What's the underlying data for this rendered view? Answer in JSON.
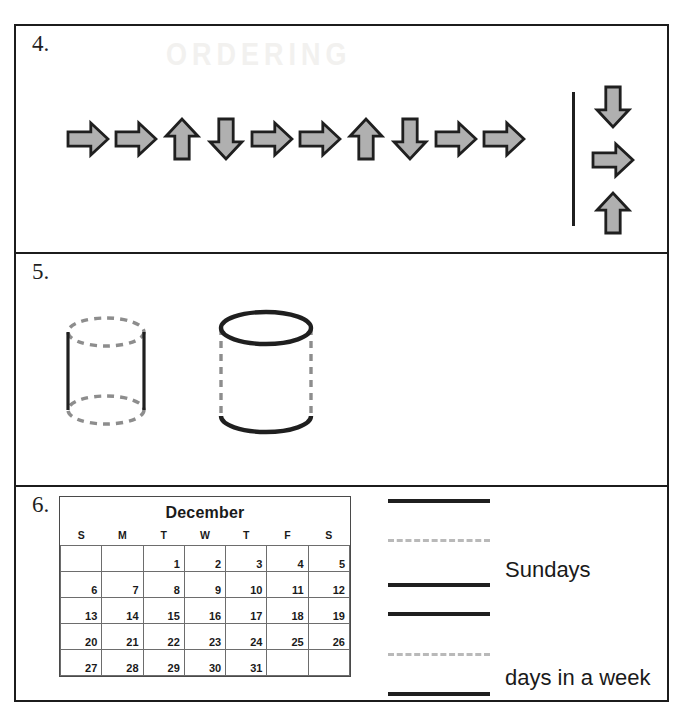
{
  "worksheet": {
    "ghost_text": "ORDERING",
    "sections": [
      {
        "number": "4.",
        "name": "arrow-pattern-question",
        "pattern": [
          {
            "direction": "right",
            "icon": "arrow-right-icon"
          },
          {
            "direction": "right",
            "icon": "arrow-right-icon"
          },
          {
            "direction": "up",
            "icon": "arrow-up-icon"
          },
          {
            "direction": "down",
            "icon": "arrow-down-icon"
          },
          {
            "direction": "right",
            "icon": "arrow-right-icon"
          },
          {
            "direction": "right",
            "icon": "arrow-right-icon"
          },
          {
            "direction": "up",
            "icon": "arrow-up-icon"
          },
          {
            "direction": "down",
            "icon": "arrow-down-icon"
          },
          {
            "direction": "right",
            "icon": "arrow-right-icon"
          },
          {
            "direction": "right",
            "icon": "arrow-right-icon"
          }
        ],
        "choices": [
          {
            "direction": "down",
            "icon": "arrow-down-icon"
          },
          {
            "direction": "right",
            "icon": "arrow-right-icon"
          },
          {
            "direction": "up",
            "icon": "arrow-up-icon"
          }
        ]
      },
      {
        "number": "5.",
        "name": "cylinder-comparison-question",
        "shapes": [
          {
            "label": "cylinder-dashed-ends",
            "edges": {
              "top": "dashed",
              "bottom": "dashed",
              "sides": "solid"
            }
          },
          {
            "label": "cylinder-solid-ends",
            "edges": {
              "top": "solid",
              "bottom": "solid",
              "sides": "dashed"
            }
          }
        ]
      },
      {
        "number": "6.",
        "name": "calendar-question",
        "calendar": {
          "title": "December",
          "weekday_headers": [
            "S",
            "M",
            "T",
            "W",
            "T",
            "F",
            "S"
          ],
          "weeks": [
            [
              "",
              "",
              "1",
              "2",
              "3",
              "4",
              "5"
            ],
            [
              "6",
              "7",
              "8",
              "9",
              "10",
              "11",
              "12"
            ],
            [
              "13",
              "14",
              "15",
              "16",
              "17",
              "18",
              "19"
            ],
            [
              "20",
              "21",
              "22",
              "23",
              "24",
              "25",
              "26"
            ],
            [
              "27",
              "28",
              "29",
              "30",
              "31",
              "",
              ""
            ]
          ]
        },
        "answer_lines": [
          {
            "style": "solid",
            "label": ""
          },
          {
            "style": "faint",
            "label": ""
          },
          {
            "style": "solid",
            "label": "Sundays"
          },
          {
            "style": "solid",
            "label": ""
          },
          {
            "style": "faint",
            "label": ""
          },
          {
            "style": "solid",
            "label": "days in a week"
          }
        ],
        "labels": {
          "sundays": "Sundays",
          "days_in_a_week": "days in a week"
        }
      }
    ]
  },
  "colors": {
    "ink": "#1f1f1f",
    "arrow_fill": "#b0b0b0",
    "arrow_stroke": "#1f1f1f",
    "dashed_gray": "#8d8d8d",
    "faint_line": "#b9b9b9",
    "paper": "#ffffff"
  }
}
